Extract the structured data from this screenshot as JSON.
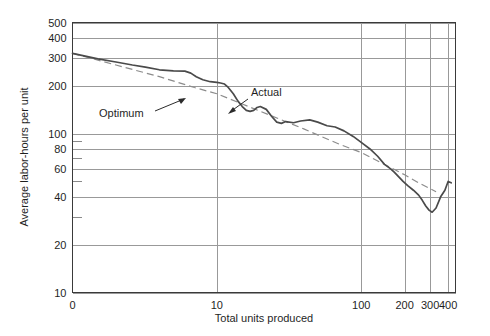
{
  "chart_data": {
    "type": "line",
    "title": "",
    "xlabel": "Total units produced",
    "ylabel": "Average labor-hours per unit",
    "xscale": "log",
    "yscale": "log",
    "xlim": [
      1,
      450
    ],
    "ylim": [
      10,
      500
    ],
    "grid": true,
    "legend_position": "inline-annotations",
    "x_tick_labels": [
      "0",
      "10",
      "100",
      "200",
      "300",
      "400"
    ],
    "x_tick_values": [
      1,
      10,
      100,
      200,
      300,
      400
    ],
    "y_tick_labels": [
      "500",
      "400",
      "300",
      "200",
      "100",
      "80",
      "60",
      "40",
      "20",
      "10"
    ],
    "y_tick_values": [
      500,
      400,
      300,
      200,
      100,
      80,
      60,
      40,
      20,
      10
    ],
    "y_minor_tick_values": [
      90,
      70,
      50,
      30
    ],
    "annotations": [
      {
        "text": "Optimum",
        "points_to_series": "Optimum"
      },
      {
        "text": "Actual",
        "points_to_series": "Actual"
      }
    ],
    "series": [
      {
        "name": "Optimum",
        "style": "dashed",
        "color": "#8c8c8c",
        "x": [
          1,
          2,
          4,
          7,
          10,
          20,
          40,
          70,
          100,
          150,
          200,
          250,
          300,
          330
        ],
        "values": [
          320,
          270,
          228,
          195,
          178,
          138,
          107,
          86,
          76,
          63,
          55,
          49,
          45,
          43
        ]
      },
      {
        "name": "Actual",
        "style": "solid",
        "color": "#4a4a4a",
        "x": [
          1,
          1.5,
          2,
          2.6,
          3.2,
          4,
          5,
          6,
          6.6,
          7.2,
          8,
          9,
          10,
          10.6,
          11.3,
          12,
          13,
          14,
          15,
          16,
          17,
          18,
          19,
          20,
          22,
          24,
          26,
          28,
          30,
          34,
          38,
          44,
          50,
          58,
          66,
          76,
          88,
          100,
          115,
          130,
          145,
          160,
          170,
          180,
          195,
          210,
          230,
          250,
          265,
          280,
          295,
          310,
          330,
          355,
          380,
          400,
          420
        ],
        "values": [
          320,
          295,
          282,
          270,
          262,
          252,
          248,
          247,
          240,
          228,
          218,
          212,
          210,
          208,
          205,
          195,
          178,
          160,
          148,
          140,
          138,
          140,
          146,
          148,
          142,
          128,
          118,
          116,
          119,
          117,
          120,
          122,
          118,
          112,
          110,
          104,
          96,
          88,
          80,
          72,
          64,
          60,
          57,
          54,
          50,
          47,
          44,
          41,
          38,
          35,
          33,
          32,
          34,
          40,
          44,
          50,
          49
        ]
      }
    ]
  },
  "chart": {
    "y_axis_title": "Average labor-hours per unit",
    "x_axis_title": "Total units produced",
    "annotation_optimum": "Optimum",
    "annotation_actual": "Actual"
  }
}
